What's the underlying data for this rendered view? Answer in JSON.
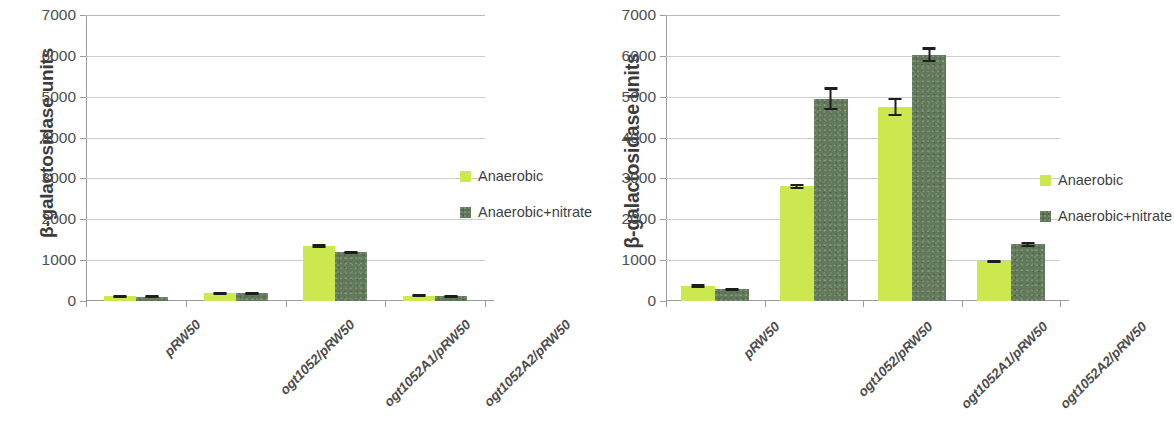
{
  "figure": {
    "panels": [
      {
        "id": "panel-a",
        "ytitle": "β-galactosidase units",
        "legend": [
          {
            "label": "Anaerobic",
            "color": "#cbe84e"
          },
          {
            "label": "Anaerobic+nitrate",
            "color": "#62795a"
          }
        ],
        "chart_data": {
          "type": "bar",
          "title": "",
          "xlabel": "",
          "ylabel": "β-galactosidase units",
          "ylim": [
            0,
            7000
          ],
          "yticks": [
            0,
            1000,
            2000,
            3000,
            4000,
            5000,
            6000,
            7000
          ],
          "ytick_labels": [
            "0",
            "1000",
            "2000",
            "3000",
            "4000",
            "5000",
            "6000",
            "7000"
          ],
          "grid": true,
          "legend_position": "right",
          "categories": [
            "pRW50",
            "ogt1052/pRW50",
            "ogt1052A1/pRW50",
            "ogt1052A2/pRW50"
          ],
          "series": [
            {
              "name": "Anaerobic",
              "color": "#cbe84e",
              "values": [
                120,
                190,
                1350,
                130
              ],
              "errors": [
                25,
                30,
                50,
                30
              ]
            },
            {
              "name": "Anaerobic+nitrate",
              "color": "#62795a",
              "values": [
                110,
                190,
                1190,
                120
              ],
              "errors": [
                25,
                30,
                40,
                30
              ]
            }
          ]
        }
      },
      {
        "id": "panel-b",
        "ytitle": "β-galactosidase units",
        "legend": [
          {
            "label": "Anaerobic",
            "color": "#cbe84e"
          },
          {
            "label": "Anaerobic+nitrate",
            "color": "#62795a"
          }
        ],
        "chart_data": {
          "type": "bar",
          "title": "",
          "xlabel": "",
          "ylabel": "β-galactosidase units",
          "ylim": [
            0,
            7000
          ],
          "yticks": [
            0,
            1000,
            2000,
            3000,
            4000,
            5000,
            6000,
            7000
          ],
          "ytick_labels": [
            "0",
            "1000",
            "2000",
            "3000",
            "4000",
            "5000",
            "6000",
            "7000"
          ],
          "grid": true,
          "legend_position": "right",
          "categories": [
            "pRW50",
            "ogt1052/pRW50",
            "ogt1052A1/pRW50",
            "ogt1052A2/pRW50"
          ],
          "series": [
            {
              "name": "Anaerobic",
              "color": "#cbe84e",
              "values": [
                370,
                2810,
                4750,
                970
              ],
              "errors": [
                45,
                60,
                230,
                45
              ]
            },
            {
              "name": "Anaerobic+nitrate",
              "color": "#62795a",
              "values": [
                290,
                4950,
                6030,
                1390
              ],
              "errors": [
                40,
                280,
                180,
                60
              ]
            }
          ]
        }
      }
    ]
  }
}
